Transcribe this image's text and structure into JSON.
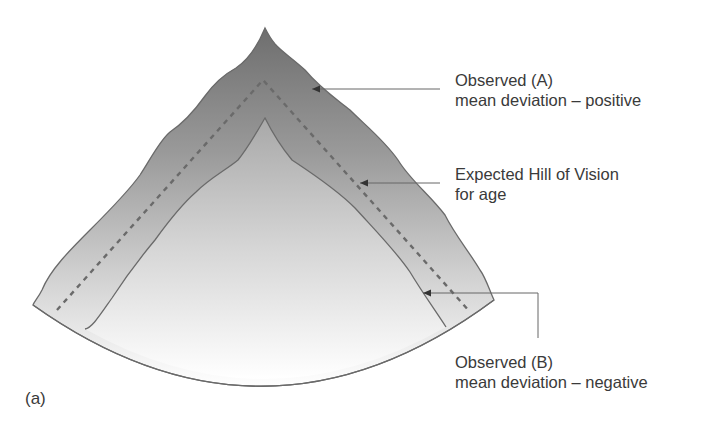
{
  "figure": {
    "panel_label": "(a)",
    "colors": {
      "hill_top": "#6e6e6e",
      "hill_bottom": "#ffffff",
      "outline": "#6a6a6a",
      "dashed_line": "#6a6a6a",
      "leader_line": "#666666",
      "text": "#3a3a3a"
    }
  },
  "annotations": [
    {
      "id": "observed-a",
      "line1": "Observed (A)",
      "line2": "mean deviation – positive"
    },
    {
      "id": "expected",
      "line1": "Expected Hill of Vision",
      "line2": "for age"
    },
    {
      "id": "observed-b",
      "line1": "Observed (B)",
      "line2": "mean deviation – negative"
    }
  ],
  "curves": [
    {
      "name": "Observed (A) outer hill",
      "style": "solid"
    },
    {
      "name": "Expected Hill of Vision for age",
      "style": "dashed"
    },
    {
      "name": "Observed (B) inner hill",
      "style": "solid"
    }
  ]
}
